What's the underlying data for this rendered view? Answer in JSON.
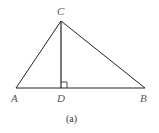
{
  "figure": {
    "caption": "(a)",
    "points": {
      "A": {
        "label": "A",
        "x": 16,
        "y": 88
      },
      "B": {
        "label": "B",
        "x": 145,
        "y": 88
      },
      "C": {
        "label": "C",
        "x": 61,
        "y": 21
      },
      "D": {
        "label": "D",
        "x": 61,
        "y": 88
      }
    },
    "segments": [
      "AB",
      "AC",
      "BC",
      "CD"
    ],
    "right_angle_at": "D",
    "stroke_color": "#222222"
  }
}
